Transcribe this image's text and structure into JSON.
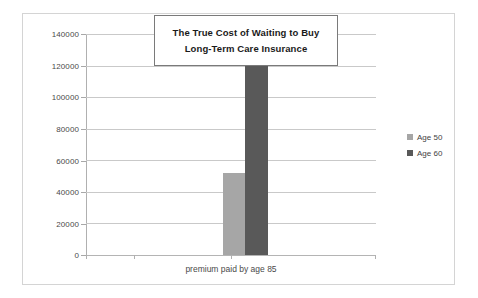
{
  "chart_data": {
    "type": "bar",
    "title": "The True Cost of Waiting to Buy Long-Term Care Insurance",
    "title_lines": [
      "The True Cost of Waiting to Buy",
      "Long-Term Care Insurance"
    ],
    "categories": [
      "premium paid by age 85"
    ],
    "xlabel": "premium paid by age 85",
    "ylabel": "",
    "ylim": [
      0,
      140000
    ],
    "ytick_labels": [
      "140000",
      "120000",
      "100000",
      "80000",
      "60000",
      "40000",
      "20000",
      "0"
    ],
    "ytick_values": [
      140000,
      120000,
      100000,
      80000,
      60000,
      40000,
      20000,
      0
    ],
    "grid": true,
    "legend_position": "right",
    "series": [
      {
        "name": "Age 50",
        "values": [
          52000
        ],
        "color": "#a6a6a6"
      },
      {
        "name": "Age 60",
        "values": [
          133000
        ],
        "color": "#595959"
      }
    ]
  },
  "legend": {
    "items": [
      {
        "label": "Age 50",
        "color": "#a6a6a6"
      },
      {
        "label": "Age 60",
        "color": "#595959"
      }
    ]
  },
  "colors": {
    "age_50": "#a6a6a6",
    "age_60": "#595959",
    "gridline": "#c9c9c9",
    "axis": "#b0b0b0",
    "frame_border": "#d4d4d4",
    "title_border": "#7a7a7a",
    "text": "#4a4a4a"
  }
}
